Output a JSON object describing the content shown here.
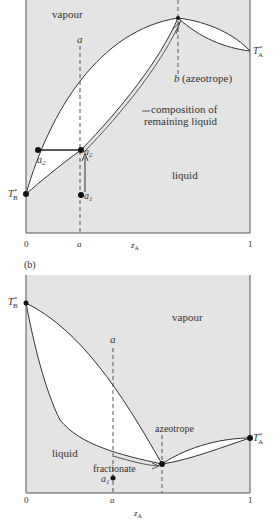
{
  "colors": {
    "shade": "#e4e4e4",
    "line": "#333333",
    "background": "#ffffff"
  },
  "panel_a": {
    "region_vapour": "vapour",
    "region_liquid": "liquid",
    "dashed_label_a": "a",
    "azeotrope_label": "b (azeotrope)",
    "azeotrope_b": "b",
    "azeotrope_text": "(azeotrope)",
    "annotation_line1": "composition of",
    "annotation_line2": "remaining liquid",
    "point_a1": "a",
    "point_a1_sub": "1",
    "point_a2_left": "a",
    "point_a2_left_sub": "2",
    "point_a2_right": "a",
    "point_a2_right_sub": "2",
    "TA": "T",
    "TA_sub": "A",
    "TB": "T",
    "TB_sub": "B",
    "star": "*",
    "x_ticks": [
      "0",
      "a",
      "1"
    ],
    "x_label": "z",
    "x_label_sub": "A"
  },
  "panel_b": {
    "panel_label": "(b)",
    "region_vapour": "vapour",
    "region_liquid": "liquid",
    "dashed_label_a": "a",
    "azeotrope_label": "azeotrope",
    "fractionate_label": "fractionate",
    "point_a1": "a",
    "point_a1_sub": "1",
    "TA": "T",
    "TA_sub": "A",
    "TB": "T",
    "TB_sub": "B",
    "star": "*",
    "x_ticks": [
      "0",
      "a",
      "1"
    ],
    "x_label": "z",
    "x_label_sub": "A"
  }
}
